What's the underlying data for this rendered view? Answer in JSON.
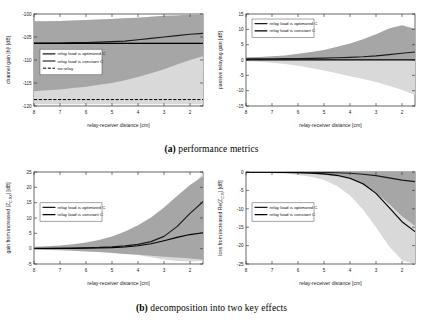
{
  "figure": {
    "caption_a_tag": "(a)",
    "caption_a_text": "performance metrics",
    "caption_b_tag": "(b)",
    "caption_b_text": "decomposition into two key effects"
  },
  "legend_labels": {
    "optimized": "relay load is optimized C",
    "constant": "relay load is constant C",
    "norelay": "no relay"
  },
  "colors": {
    "band_light": "#d9d9d9",
    "band_dark": "#a6a6a6",
    "line_dark": "#1a1a1a",
    "frame": "#262626",
    "grid": "#bfbfbf"
  },
  "chart_data": [
    {
      "id": "channel-gain",
      "type": "line",
      "position": "top-left",
      "title": "",
      "xlabel": "relay-receiver distance [cm]",
      "ylabel": "channel gain |h|² [dB]",
      "xlim": [
        8,
        1.5
      ],
      "ylim": [
        -120,
        -100
      ],
      "xticks": [
        8,
        7,
        6,
        5,
        4,
        3,
        2
      ],
      "yticks": [
        -100,
        -105,
        -110,
        -115,
        -120
      ],
      "x_reversed": true,
      "grid": false,
      "legend_position": "center-left",
      "legend_entries": [
        "relay load is optimized C",
        "relay load is constant C",
        "no relay"
      ],
      "x": [
        8,
        7.5,
        7,
        6.5,
        6,
        5.5,
        5,
        4.5,
        4,
        3.5,
        3,
        2.5,
        2,
        1.5
      ],
      "series": [
        {
          "name": "relay load is optimized C",
          "style": "solid",
          "values": [
            -106.3,
            -106.3,
            -106.3,
            -106.2,
            -106.2,
            -106.1,
            -106.0,
            -105.9,
            -105.6,
            -105.3,
            -105.0,
            -104.7,
            -104.4,
            -104.2
          ],
          "band_lower": [
            -116.8,
            -116.6,
            -116.4,
            -116.1,
            -115.8,
            -115.4,
            -115.0,
            -114.4,
            -113.7,
            -112.9,
            -112.0,
            -111.0,
            -110.0,
            -109.2
          ],
          "band_upper": [
            -101.6,
            -101.6,
            -101.5,
            -101.4,
            -101.3,
            -101.2,
            -101.1,
            -100.9,
            -100.8,
            -100.6,
            -100.4,
            -100.3,
            -100.1,
            -100.0
          ],
          "band_color": "#a6a6a6"
        },
        {
          "name": "relay load is constant C",
          "style": "solid",
          "values": [
            -106.4,
            -106.4,
            -106.4,
            -106.4,
            -106.4,
            -106.4,
            -106.4,
            -106.4,
            -106.4,
            -106.4,
            -106.4,
            -106.4,
            -106.4,
            -106.4
          ],
          "band_lower": [
            -119.6,
            -119.6,
            -119.6,
            -119.6,
            -119.6,
            -119.6,
            -119.6,
            -119.6,
            -119.6,
            -119.6,
            -119.6,
            -119.6,
            -119.6,
            -119.6
          ],
          "band_upper": [
            -101.6,
            -101.6,
            -101.5,
            -101.4,
            -101.3,
            -101.2,
            -101.1,
            -100.9,
            -100.8,
            -100.6,
            -100.4,
            -100.3,
            -100.1,
            -100.0
          ],
          "band_color": "#d9d9d9"
        },
        {
          "name": "no relay",
          "style": "dashed",
          "values": [
            -106.4,
            -106.4,
            -106.4,
            -106.4,
            -106.4,
            -106.4,
            -106.4,
            -106.4,
            -106.4,
            -106.4,
            -106.4,
            -106.4,
            -106.4,
            -106.4
          ]
        },
        {
          "name": "no relay lower",
          "style": "dashed",
          "values": [
            -118.6,
            -118.6,
            -118.6,
            -118.6,
            -118.6,
            -118.6,
            -118.6,
            -118.6,
            -118.6,
            -118.6,
            -118.6,
            -118.6,
            -118.6,
            -118.6
          ]
        }
      ]
    },
    {
      "id": "passive-relaying-gain",
      "type": "line",
      "position": "top-right",
      "title": "",
      "xlabel": "relay-receiver distance [cm]",
      "ylabel": "passive relaying gain [dB]",
      "xlim": [
        8,
        1.5
      ],
      "ylim": [
        -15,
        15
      ],
      "xticks": [
        8,
        7,
        6,
        5,
        4,
        3,
        2
      ],
      "yticks": [
        15,
        10,
        5,
        0,
        -5,
        -10,
        -15
      ],
      "x_reversed": true,
      "grid": false,
      "legend_position": "top-left",
      "legend_entries": [
        "relay load is optimized C",
        "relay load is constant C"
      ],
      "x": [
        8,
        7.5,
        7,
        6.5,
        6,
        5.5,
        5,
        4.5,
        4,
        3.5,
        3,
        2.5,
        2,
        1.5
      ],
      "series": [
        {
          "name": "relay load is optimized C",
          "style": "solid",
          "values": [
            0.35,
            0.38,
            0.4,
            0.45,
            0.5,
            0.55,
            0.62,
            0.72,
            0.85,
            1.05,
            1.35,
            1.75,
            2.2,
            2.6
          ],
          "band_lower": [
            0.0,
            0.0,
            0.0,
            0.0,
            0.0,
            0.0,
            0.0,
            0.0,
            0.0,
            0.0,
            0.0,
            0.0,
            0.0,
            0.0
          ],
          "band_upper": [
            0.9,
            1.0,
            1.2,
            1.5,
            2.0,
            2.6,
            3.3,
            4.3,
            5.4,
            6.8,
            8.4,
            10.3,
            11.3,
            10.2
          ],
          "band_color": "#a6a6a6"
        },
        {
          "name": "relay load is constant C",
          "style": "solid",
          "values": [
            0.02,
            0.02,
            0.02,
            0.02,
            0.02,
            0.02,
            0.02,
            0.02,
            0.02,
            0.02,
            0.02,
            0.02,
            0.02,
            0.02
          ],
          "band_lower": [
            -0.4,
            -0.6,
            -0.9,
            -1.3,
            -1.9,
            -2.6,
            -3.4,
            -4.3,
            -5.3,
            -6.2,
            -7.2,
            -8.4,
            -9.8,
            -11.3
          ],
          "band_upper": [
            0.0,
            0.0,
            0.0,
            0.0,
            0.0,
            0.0,
            0.0,
            0.0,
            0.0,
            0.0,
            0.0,
            0.0,
            0.0,
            0.0
          ],
          "band_color": "#d9d9d9"
        }
      ]
    },
    {
      "id": "gain-from-increased-Z",
      "type": "line",
      "position": "bottom-left",
      "title": "",
      "xlabel": "relay-receiver distance [cm]",
      "ylabel": "gain from increased |Z_C-RX| [dB]",
      "xlim": [
        8,
        1.5
      ],
      "ylim": [
        -5,
        25
      ],
      "xticks": [
        8,
        7,
        6,
        5,
        4,
        3,
        2
      ],
      "yticks": [
        25,
        20,
        15,
        10,
        5,
        0,
        -5
      ],
      "x_reversed": true,
      "grid": false,
      "legend_position": "center-left",
      "legend_entries": [
        "relay load is optimized C",
        "relay load is constant C"
      ],
      "x": [
        8,
        7.5,
        7,
        6.5,
        6,
        5.5,
        5,
        4.5,
        4,
        3.5,
        3,
        2.5,
        2,
        1.5
      ],
      "series": [
        {
          "name": "relay load is optimized C",
          "style": "solid",
          "values": [
            0.1,
            0.12,
            0.15,
            0.2,
            0.3,
            0.4,
            0.6,
            0.9,
            1.4,
            2.3,
            4.0,
            7.2,
            11.5,
            15.3
          ],
          "band_lower": [
            -0.3,
            -0.4,
            -0.5,
            -0.7,
            -0.9,
            -1.1,
            -1.4,
            -1.7,
            -2.0,
            -2.3,
            -2.6,
            -2.9,
            -3.2,
            -3.6
          ],
          "band_upper": [
            0.6,
            0.8,
            1.0,
            1.4,
            2.0,
            2.8,
            4.0,
            5.6,
            7.6,
            10.2,
            13.4,
            17.2,
            20.8,
            23.6
          ],
          "band_color": "#a6a6a6"
        },
        {
          "name": "relay load is constant C",
          "style": "solid",
          "values": [
            0.05,
            0.06,
            0.08,
            0.11,
            0.16,
            0.23,
            0.34,
            0.55,
            0.95,
            1.6,
            2.6,
            3.7,
            4.6,
            5.2
          ],
          "band_lower": [
            -0.2,
            -0.3,
            -0.4,
            -0.5,
            -0.7,
            -0.9,
            -1.2,
            -1.6,
            -2.1,
            -2.8,
            -3.5,
            -4.0,
            -4.2,
            -4.0
          ],
          "band_upper": [
            0.4,
            0.5,
            0.7,
            0.9,
            1.3,
            1.8,
            2.5,
            3.5,
            4.9,
            7.0,
            10.0,
            14.4,
            19.6,
            24.6
          ],
          "band_color": "#d9d9d9"
        }
      ]
    },
    {
      "id": "loss-from-increased-Re-Z",
      "type": "line",
      "position": "bottom-right",
      "title": "",
      "xlabel": "relay-receiver distance [cm]",
      "ylabel": "loss from increased Re(Z_C-R) [dB]",
      "xlim": [
        8,
        1.5
      ],
      "ylim": [
        -25,
        0
      ],
      "xticks": [
        8,
        7,
        6,
        5,
        4,
        3,
        2
      ],
      "yticks": [
        0,
        -5,
        -10,
        -15,
        -20,
        -25
      ],
      "x_reversed": true,
      "grid": false,
      "legend_position": "center-left",
      "legend_entries": [
        "relay load is optimized C",
        "relay load is constant C"
      ],
      "x": [
        8,
        7.5,
        7,
        6.5,
        6,
        5.5,
        5,
        4.5,
        4,
        3.5,
        3,
        2.5,
        2,
        1.5
      ],
      "series": [
        {
          "name": "relay load is optimized C",
          "style": "solid",
          "values": [
            -0.02,
            -0.02,
            -0.03,
            -0.04,
            -0.06,
            -0.08,
            -0.12,
            -0.2,
            -0.35,
            -0.6,
            -1.0,
            -1.6,
            -2.2,
            -2.6
          ],
          "band_lower": [
            -0.1,
            -0.12,
            -0.16,
            -0.22,
            -0.32,
            -0.48,
            -0.75,
            -1.2,
            -2.0,
            -3.4,
            -5.6,
            -8.6,
            -12.0,
            -14.6
          ],
          "band_upper": [
            0.0,
            0.0,
            0.0,
            0.0,
            0.0,
            0.0,
            0.0,
            0.0,
            0.0,
            0.0,
            0.0,
            0.0,
            0.0,
            0.0
          ],
          "band_color": "#a6a6a6"
        },
        {
          "name": "relay load is constant C",
          "style": "solid",
          "values": [
            -0.05,
            -0.06,
            -0.08,
            -0.12,
            -0.18,
            -0.3,
            -0.5,
            -0.9,
            -1.7,
            -3.2,
            -5.8,
            -9.6,
            -13.5,
            -16.2
          ],
          "band_lower": [
            -0.2,
            -0.25,
            -0.35,
            -0.5,
            -0.8,
            -1.3,
            -2.2,
            -3.8,
            -6.4,
            -10.2,
            -15.0,
            -20.2,
            -24.0,
            -25.0
          ],
          "band_upper": [
            0.0,
            0.0,
            0.0,
            0.0,
            0.0,
            0.0,
            0.0,
            0.0,
            0.0,
            0.0,
            0.0,
            0.0,
            0.0,
            0.0
          ],
          "band_color": "#d9d9d9"
        }
      ]
    }
  ]
}
